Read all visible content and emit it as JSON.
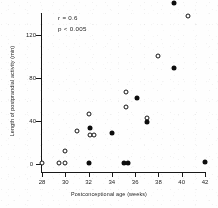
{
  "chart_data": {
    "type": "scatter",
    "title": "",
    "xlabel": "Postconceptional age (weeks)",
    "ylabel": "Length of postprandial activity (min)",
    "xlim": [
      28,
      42
    ],
    "ylim": [
      0,
      140
    ],
    "xticks": [
      28,
      30,
      32,
      34,
      36,
      38,
      40,
      42
    ],
    "yticks": [
      0,
      40,
      80,
      120
    ],
    "grid": false,
    "legend_position": "none",
    "annotations": [
      "r = 0.6",
      "p < 0.005"
    ],
    "series": [
      {
        "name": "open-circle",
        "marker": "open circle",
        "points": [
          [
            28.0,
            1
          ],
          [
            29.5,
            1
          ],
          [
            30.0,
            1
          ],
          [
            30.0,
            12
          ],
          [
            31.0,
            31
          ],
          [
            32.0,
            47
          ],
          [
            32.1,
            27
          ],
          [
            32.5,
            27
          ],
          [
            35.2,
            67
          ],
          [
            35.2,
            53
          ],
          [
            37.0,
            43
          ],
          [
            38.0,
            101
          ],
          [
            40.5,
            138
          ]
        ]
      },
      {
        "name": "filled-circle",
        "marker": "filled circle",
        "points": [
          [
            32.0,
            1
          ],
          [
            32.1,
            34
          ],
          [
            34.0,
            29
          ],
          [
            35.0,
            1
          ],
          [
            35.4,
            1
          ],
          [
            36.2,
            62
          ],
          [
            37.0,
            39
          ],
          [
            39.3,
            90
          ],
          [
            39.3,
            150
          ],
          [
            42.0,
            2
          ]
        ]
      }
    ]
  },
  "axis": {
    "ytick_labels": [
      "120",
      "80",
      "40",
      "0"
    ],
    "xtick_labels": [
      "28",
      "30",
      "32",
      "34",
      "36",
      "38",
      "40",
      "42"
    ]
  }
}
